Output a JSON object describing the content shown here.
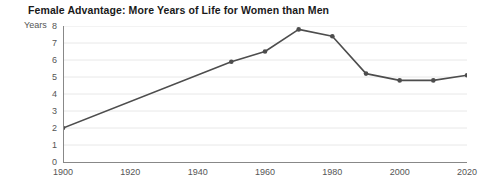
{
  "chart_data": {
    "type": "line",
    "title": "Female Advantage: More Years of Life for Women than Men",
    "xlabel": "",
    "ylabel": "Years",
    "x": [
      1900,
      1950,
      1960,
      1970,
      1980,
      1990,
      2000,
      2010,
      2020
    ],
    "values": [
      2.0,
      5.9,
      6.5,
      7.8,
      7.4,
      5.2,
      4.8,
      4.8,
      5.1
    ],
    "series": [
      {
        "name": "Female advantage in life expectancy",
        "values": [
          2.0,
          5.9,
          6.5,
          7.8,
          7.4,
          5.2,
          4.8,
          4.8,
          5.1
        ]
      }
    ],
    "xlim": [
      1900,
      2020
    ],
    "ylim": [
      0,
      8
    ],
    "xticks": [
      1900,
      1920,
      1940,
      1960,
      1980,
      2000,
      2020
    ],
    "xtick_labels": [
      "1900",
      "1920",
      "1940",
      "1960",
      "1980",
      "2000",
      "2020"
    ],
    "yticks": [
      0,
      1,
      2,
      3,
      4,
      5,
      6,
      7,
      8
    ],
    "ytick_labels": [
      "0",
      "1",
      "2",
      "3",
      "4",
      "5",
      "6",
      "7",
      "8"
    ],
    "grid": "horizontal",
    "legend": "none",
    "markers": true,
    "line_color": "#4d4d4d",
    "marker_color": "#4d4d4d",
    "grid_color": "#e8e8e8",
    "axis_color": "#888888",
    "background_color": "#ffffff",
    "title_color": "#1a1a1a",
    "tick_label_color": "#555555"
  }
}
